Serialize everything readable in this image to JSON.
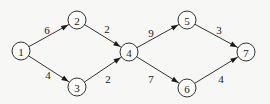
{
  "diagram": {
    "type": "directed-network",
    "background": "#f7f7f5",
    "stroke_color": "#333333",
    "nodes": [
      {
        "id": "1",
        "label": "1",
        "x": 21,
        "y": 51
      },
      {
        "id": "2",
        "label": "2",
        "x": 77,
        "y": 20
      },
      {
        "id": "3",
        "label": "3",
        "x": 77,
        "y": 87
      },
      {
        "id": "4",
        "label": "4",
        "x": 129,
        "y": 52
      },
      {
        "id": "5",
        "label": "5",
        "x": 187,
        "y": 20
      },
      {
        "id": "6",
        "label": "6",
        "x": 187,
        "y": 88
      },
      {
        "id": "7",
        "label": "7",
        "x": 246,
        "y": 52
      }
    ],
    "edges": [
      {
        "from": "1",
        "to": "2",
        "weight": "6",
        "lx": 47,
        "ly": 30
      },
      {
        "from": "1",
        "to": "3",
        "weight": "4",
        "lx": 48,
        "ly": 75
      },
      {
        "from": "2",
        "to": "4",
        "weight": "2",
        "lx": 107,
        "ly": 29
      },
      {
        "from": "3",
        "to": "4",
        "weight": "2",
        "lx": 108,
        "ly": 79
      },
      {
        "from": "4",
        "to": "5",
        "weight": "9",
        "lx": 151,
        "ly": 33
      },
      {
        "from": "4",
        "to": "6",
        "weight": "7",
        "lx": 151,
        "ly": 79
      },
      {
        "from": "5",
        "to": "7",
        "weight": "3",
        "lx": 219,
        "ly": 30
      },
      {
        "from": "6",
        "to": "7",
        "weight": "4",
        "lx": 221,
        "ly": 79
      }
    ]
  }
}
